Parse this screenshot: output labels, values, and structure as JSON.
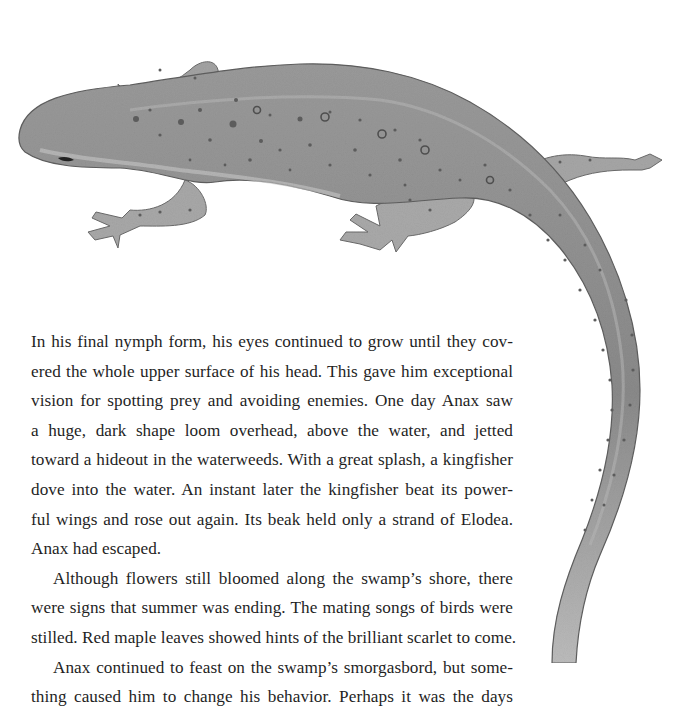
{
  "page": {
    "illustration": {
      "subject": "salamander-illustration",
      "colors": {
        "body": "#8f8f8f",
        "body_light": "#bdbdbd",
        "body_dark": "#6e6e6e",
        "spots": "#5a5a5a",
        "outline": "#5c5c5c"
      }
    },
    "paragraphs": [
      {
        "indent": false,
        "lines": [
          "In his final nymph form, his eyes continued to grow until they cov-",
          "ered the whole upper surface of his head. This gave him exceptional",
          "vision for spotting prey and avoiding enemies. One day Anax saw",
          "a huge, dark shape loom overhead, above the water, and jetted",
          "toward a hideout in the waterweeds. With a great splash, a kingfisher",
          "dove into the water. An instant later the kingfisher beat its power-",
          "ful wings and rose out again. Its beak held only a strand of Elodea.",
          "Anax had escaped."
        ]
      },
      {
        "indent": true,
        "lines": [
          "Although flowers still bloomed along the swamp’s shore, there",
          "were signs that summer was ending. The mating songs of birds were",
          "stilled. Red maple leaves showed hints of the brilliant scarlet to come."
        ]
      },
      {
        "indent": true,
        "lines": [
          "Anax continued to feast on the swamp’s smorgasbord, but some-",
          "thing caused him to change his behavior. Perhaps it was the days"
        ]
      }
    ]
  }
}
